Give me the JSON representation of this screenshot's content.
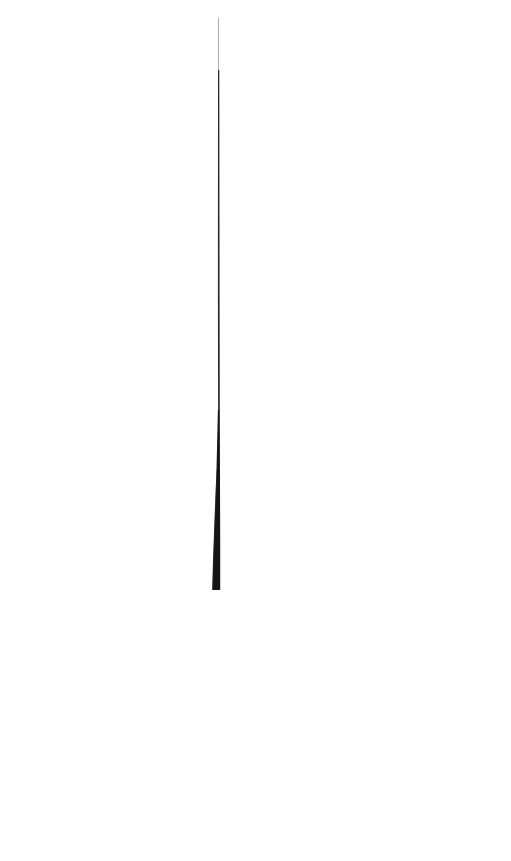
{
  "image": {
    "width": 511,
    "height": 861,
    "background_color": "#ffffff",
    "stroke_color": "#151515"
  },
  "stroke": {
    "description": "single tapering vertical ink stroke",
    "top_x": 218.5,
    "top_y": 18,
    "bottom_y": 590,
    "bottom_left_x": 212,
    "bottom_right_x": 220
  }
}
